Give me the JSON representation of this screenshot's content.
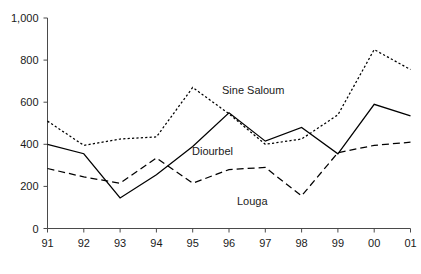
{
  "chart_data": {
    "type": "line",
    "title": "",
    "xlabel": "",
    "ylabel": "",
    "x": [
      "91",
      "92",
      "93",
      "94",
      "95",
      "96",
      "97",
      "98",
      "99",
      "00",
      "01"
    ],
    "categories": [
      "91",
      "92",
      "93",
      "94",
      "95",
      "96",
      "97",
      "98",
      "99",
      "00",
      "01"
    ],
    "ylim": [
      0,
      1000
    ],
    "yticks": [
      0,
      200,
      400,
      600,
      800,
      1000
    ],
    "ytick_labels": [
      "0",
      "200",
      "400",
      "600",
      "800",
      "1,000"
    ],
    "xtick_labels": [
      "91",
      "92",
      "93",
      "94",
      "95",
      "96",
      "97",
      "98",
      "99",
      "00",
      "01"
    ],
    "grid": false,
    "legend_position": "inline-annotations",
    "series": [
      {
        "name": "Diourbel",
        "style": "solid",
        "color": "#000000",
        "values": [
          400,
          355,
          145,
          255,
          390,
          550,
          415,
          480,
          355,
          590,
          535
        ],
        "label_x": "96",
        "label_value": 445
      },
      {
        "name": "Sine Saloum",
        "style": "dotted",
        "color": "#000000",
        "values": [
          510,
          395,
          425,
          435,
          670,
          545,
          400,
          425,
          540,
          850,
          755
        ],
        "label_x": "96",
        "label_value": 690
      },
      {
        "name": "Louga",
        "style": "dashed",
        "color": "#000000",
        "values": [
          285,
          245,
          215,
          335,
          215,
          280,
          290,
          155,
          360,
          395,
          410
        ],
        "label_x": "97",
        "label_value": 175
      }
    ],
    "annotations": [
      {
        "text": "Sine Saloum",
        "x_px": 222,
        "y_px": 94
      },
      {
        "text": "Diourbel",
        "x_px": 192,
        "y_px": 155
      },
      {
        "text": "Louga",
        "x_px": 237,
        "y_px": 205
      }
    ]
  },
  "axis": {
    "y_tick_labels": [
      "1,000",
      "800",
      "600",
      "400",
      "200",
      "0"
    ],
    "x_tick_labels": [
      "91",
      "92",
      "93",
      "94",
      "95",
      "96",
      "97",
      "98",
      "99",
      "00",
      "01"
    ]
  }
}
